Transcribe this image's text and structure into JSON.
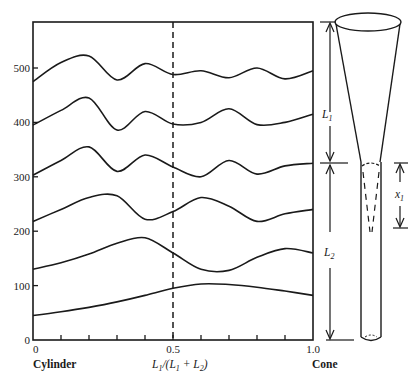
{
  "chart_data": {
    "type": "line",
    "title": "",
    "xlabel": "L1/(L1 + L2)",
    "xlabel_parts": {
      "main": "L",
      "sub1": "1",
      "mid": "/(L",
      "sub2": "1",
      "plus": " + L",
      "sub3": "2",
      "end": ")"
    },
    "x_left_label": "Cylinder",
    "x_right_label": "Cone",
    "ylabel": "",
    "xlim": [
      0,
      1.0
    ],
    "ylim": [
      0,
      550
    ],
    "x_ticks": [
      0,
      0.1,
      0.2,
      0.3,
      0.4,
      0.5,
      0.6,
      0.7,
      0.8,
      0.9,
      1.0
    ],
    "x_tick_labels": [
      {
        "x": 0,
        "label": "0"
      },
      {
        "x": 0.5,
        "label": "0.5"
      },
      {
        "x": 1.0,
        "label": "1.0"
      }
    ],
    "y_ticks": [
      0,
      100,
      200,
      300,
      400,
      500
    ],
    "y_tick_labels": [
      "0",
      "100",
      "200",
      "300",
      "400",
      "500"
    ],
    "grid": false,
    "legend": null,
    "annotations": [
      {
        "type": "vline",
        "x": 0.5,
        "style": "dashed"
      }
    ],
    "series": [
      {
        "name": "mode 1",
        "x": [
          0,
          0.1,
          0.2,
          0.3,
          0.4,
          0.5,
          0.6,
          0.7,
          0.8,
          0.9,
          1.0
        ],
        "values": [
          45,
          52,
          60,
          70,
          82,
          95,
          103,
          102,
          97,
          90,
          82
        ]
      },
      {
        "name": "mode 2",
        "x": [
          0,
          0.1,
          0.2,
          0.3,
          0.4,
          0.5,
          0.6,
          0.7,
          0.8,
          0.9,
          1.0
        ],
        "values": [
          130,
          142,
          158,
          178,
          188,
          160,
          130,
          128,
          152,
          168,
          160
        ]
      },
      {
        "name": "mode 3",
        "x": [
          0,
          0.1,
          0.2,
          0.3,
          0.4,
          0.5,
          0.6,
          0.7,
          0.8,
          0.9,
          1.0
        ],
        "values": [
          218,
          240,
          262,
          265,
          222,
          236,
          262,
          246,
          218,
          232,
          240
        ]
      },
      {
        "name": "mode 4",
        "x": [
          0,
          0.1,
          0.2,
          0.3,
          0.4,
          0.5,
          0.6,
          0.7,
          0.8,
          0.9,
          1.0
        ],
        "values": [
          303,
          330,
          355,
          310,
          340,
          318,
          300,
          330,
          305,
          320,
          325
        ]
      },
      {
        "name": "mode 5",
        "x": [
          0,
          0.1,
          0.2,
          0.3,
          0.4,
          0.5,
          0.6,
          0.7,
          0.8,
          0.9,
          1.0
        ],
        "values": [
          395,
          422,
          445,
          386,
          420,
          397,
          400,
          425,
          396,
          400,
          415
        ]
      },
      {
        "name": "mode 6",
        "x": [
          0,
          0.1,
          0.2,
          0.3,
          0.4,
          0.5,
          0.6,
          0.7,
          0.8,
          0.9,
          1.0
        ],
        "values": [
          475,
          510,
          522,
          478,
          508,
          488,
          495,
          482,
          500,
          480,
          495
        ]
      }
    ]
  },
  "diagram": {
    "labels": {
      "L1": {
        "main": "L",
        "sub": "1"
      },
      "L2": {
        "main": "L",
        "sub": "2"
      },
      "x1": {
        "main": "x",
        "sub": "1"
      }
    },
    "parts": [
      "cone",
      "cylinder-tube",
      "dimension-L1",
      "dimension-L2",
      "dimension-x1"
    ]
  }
}
